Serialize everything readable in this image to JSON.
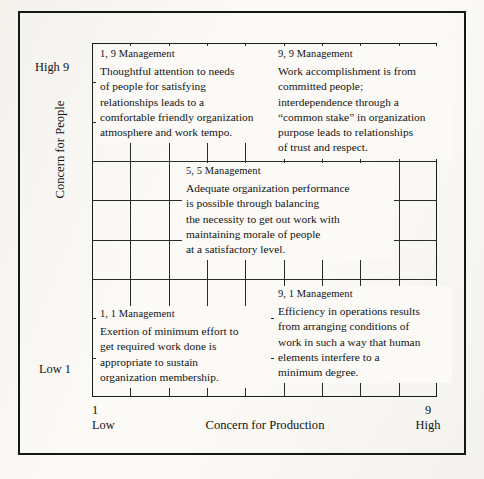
{
  "diagram": {
    "name": "managerial-grid",
    "grid": {
      "columns": 9,
      "rows": 9
    },
    "ink_color": "#1c1c1c",
    "paper_color": "#fbfaf7"
  },
  "axes": {
    "y": {
      "title": "Concern for People",
      "high_label": "High 9",
      "low_label": "Low 1",
      "min": 1,
      "max": 9
    },
    "x": {
      "title": "Concern for Production",
      "low_value": "1",
      "low_word": "Low",
      "high_value": "9",
      "high_word": "High",
      "min": 1,
      "max": 9
    }
  },
  "styles": [
    {
      "id": "1-9",
      "coordinates": [
        1,
        9
      ],
      "title": "1, 9 Management",
      "lines": [
        "Thoughtful attention to needs",
        "of people for satisfying",
        "relationships leads to a",
        "comfortable friendly organization",
        "atmosphere and work tempo."
      ]
    },
    {
      "id": "9-9",
      "coordinates": [
        9,
        9
      ],
      "title": "9, 9 Management",
      "lines": [
        "Work accomplishment is from",
        "committed people;",
        "interdependence through a",
        "“common stake” in organization",
        "purpose leads to relationships",
        "of trust and respect."
      ]
    },
    {
      "id": "5-5",
      "coordinates": [
        5,
        5
      ],
      "title": "5, 5 Management",
      "lines": [
        "Adequate organization performance",
        "is possible through balancing",
        "the necessity to get out work with",
        "maintaining morale of people",
        "at a satisfactory level."
      ]
    },
    {
      "id": "1-1",
      "coordinates": [
        1,
        1
      ],
      "title": "1, 1 Management",
      "lines": [
        "Exertion of minimum effort to",
        "get required work done is",
        "appropriate to sustain",
        "organization membership."
      ]
    },
    {
      "id": "9-1",
      "coordinates": [
        9,
        1
      ],
      "title": "9, 1 Management",
      "lines": [
        "Efficiency in operations results",
        "from arranging conditions of",
        "work in such a way that human",
        "elements interfere to a",
        "minimum degree."
      ]
    }
  ]
}
